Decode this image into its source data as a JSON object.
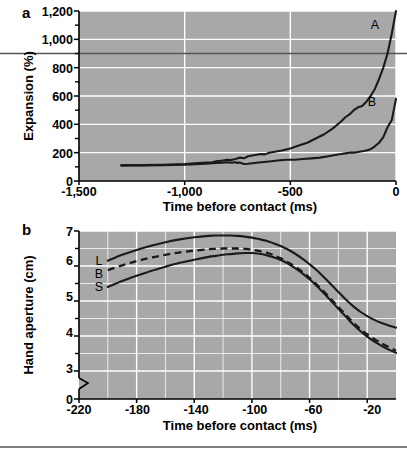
{
  "figure": {
    "panels": [
      "a",
      "b"
    ],
    "background": "#ffffff",
    "plot_bg": "#a8a8a8",
    "gridline_color": "#ffffff",
    "curve_color": "#1a1a1a",
    "reference_line_color": "#555555"
  },
  "panel_a": {
    "label": "a",
    "ylabel": "Expansion (%)",
    "xlabel": "Time before contact (ms)",
    "yticks": [
      "0",
      "200",
      "400",
      "600",
      "800",
      "1,000",
      "1,200"
    ],
    "xticks": [
      "-1,500",
      "-1,000",
      "-500",
      "0"
    ],
    "curve_labels": {
      "a": "A",
      "b": "B"
    }
  },
  "panel_b": {
    "label": "b",
    "ylabel": "Hand aperture (cm)",
    "xlabel": "Time before contact (ms)",
    "yticks": [
      "0",
      "3",
      "4",
      "5",
      "6",
      "7"
    ],
    "xticks": [
      "-220",
      "-180",
      "-140",
      "-100",
      "-60",
      "-20"
    ],
    "series_labels": {
      "l": "L",
      "b": "B",
      "s": "S"
    },
    "axis_break": true
  },
  "chart_data": [
    {
      "type": "line",
      "panel": "a",
      "title": "",
      "xlabel": "Time before contact (ms)",
      "ylabel": "Expansion (%)",
      "xlim": [
        -1500,
        0
      ],
      "ylim": [
        0,
        1200
      ],
      "xticks": [
        -1500,
        -1000,
        -500,
        0
      ],
      "yticks": [
        0,
        200,
        400,
        600,
        800,
        1000,
        1200
      ],
      "yminorticks": [
        100,
        300,
        500,
        700,
        900,
        1100
      ],
      "grid": true,
      "legend": "inline-curve-labels",
      "annotations": [
        {
          "text": "A",
          "x": -110,
          "y": 1090
        },
        {
          "text": "B",
          "x": -55,
          "y": 560
        }
      ],
      "reference_line": {
        "y": 900,
        "orientation": "horizontal",
        "spans_full_width": true
      },
      "series": [
        {
          "name": "A",
          "style": "solid",
          "x": [
            -1300,
            -1200,
            -1100,
            -1000,
            -950,
            -900,
            -870,
            -850,
            -820,
            -800,
            -780,
            -760,
            -740,
            -720,
            -700,
            -680,
            -660,
            -640,
            -620,
            -600,
            -580,
            -560,
            -540,
            -500,
            -460,
            -420,
            -380,
            -340,
            -300,
            -260,
            -240,
            -220,
            -200,
            -180,
            -160,
            -140,
            -120,
            -100,
            -80,
            -60,
            -40,
            -20,
            0
          ],
          "y": [
            110,
            112,
            115,
            120,
            125,
            130,
            132,
            140,
            145,
            150,
            148,
            155,
            165,
            160,
            175,
            180,
            185,
            190,
            188,
            200,
            205,
            210,
            215,
            230,
            250,
            270,
            300,
            330,
            370,
            420,
            450,
            470,
            500,
            520,
            530,
            560,
            600,
            650,
            720,
            800,
            900,
            1040,
            1200
          ]
        },
        {
          "name": "B",
          "style": "solid",
          "x": [
            -1300,
            -1200,
            -1100,
            -1000,
            -950,
            -900,
            -870,
            -850,
            -820,
            -800,
            -780,
            -760,
            -750,
            -740,
            -720,
            -700,
            -680,
            -650,
            -600,
            -560,
            -520,
            -480,
            -440,
            -400,
            -360,
            -320,
            -300,
            -280,
            -260,
            -240,
            -220,
            -200,
            -180,
            -160,
            -140,
            -120,
            -100,
            -80,
            -60,
            -40,
            -20,
            0
          ],
          "y": [
            110,
            110,
            112,
            115,
            118,
            122,
            125,
            128,
            130,
            132,
            130,
            132,
            128,
            130,
            120,
            122,
            125,
            130,
            138,
            145,
            150,
            150,
            155,
            160,
            165,
            175,
            180,
            185,
            190,
            195,
            200,
            200,
            205,
            210,
            215,
            225,
            245,
            270,
            310,
            380,
            430,
            580
          ]
        }
      ]
    },
    {
      "type": "line",
      "panel": "b",
      "title": "",
      "xlabel": "Time before contact (ms)",
      "ylabel": "Hand aperture (cm)",
      "xlim": [
        -220,
        0
      ],
      "ylim": [
        3,
        7
      ],
      "xticks": [
        -220,
        -180,
        -140,
        -100,
        -60,
        -20
      ],
      "yticks": [
        0,
        3,
        4,
        5,
        6,
        7
      ],
      "yminorticks": [
        3.5,
        4.5,
        5.5,
        6.5
      ],
      "grid": true,
      "axis_break_between": [
        0,
        3
      ],
      "legend": "inline-series-labels",
      "series": [
        {
          "name": "L",
          "style": "solid",
          "x": [
            -200,
            -190,
            -180,
            -170,
            -160,
            -150,
            -140,
            -130,
            -125,
            -120,
            -115,
            -110,
            -105,
            -100,
            -95,
            -90,
            -85,
            -80,
            -75,
            -70,
            -65,
            -60,
            -55,
            -50,
            -45,
            -40,
            -35,
            -30,
            -25,
            -20,
            -15,
            -10,
            -5,
            0
          ],
          "y": [
            6.15,
            6.32,
            6.46,
            6.58,
            6.68,
            6.76,
            6.82,
            6.86,
            6.87,
            6.87,
            6.87,
            6.86,
            6.84,
            6.81,
            6.77,
            6.72,
            6.65,
            6.57,
            6.47,
            6.35,
            6.21,
            6.05,
            5.88,
            5.68,
            5.47,
            5.26,
            5.05,
            4.86,
            4.7,
            4.57,
            4.46,
            4.37,
            4.3,
            4.24
          ]
        },
        {
          "name": "B",
          "style": "dashed",
          "x": [
            -200,
            -190,
            -180,
            -170,
            -160,
            -150,
            -140,
            -130,
            -125,
            -120,
            -115,
            -110,
            -105,
            -100,
            -95,
            -90,
            -85,
            -80,
            -75,
            -70,
            -65,
            -60,
            -55,
            -50,
            -45,
            -40,
            -35,
            -30,
            -25,
            -20,
            -15,
            -10,
            -5,
            0
          ],
          "y": [
            5.88,
            6.02,
            6.14,
            6.24,
            6.32,
            6.39,
            6.44,
            6.48,
            6.49,
            6.5,
            6.5,
            6.5,
            6.49,
            6.47,
            6.43,
            6.38,
            6.31,
            6.22,
            6.11,
            5.98,
            5.83,
            5.66,
            5.47,
            5.27,
            5.05,
            4.83,
            4.61,
            4.4,
            4.21,
            4.05,
            3.91,
            3.79,
            3.68,
            3.58
          ]
        },
        {
          "name": "S",
          "style": "solid",
          "x": [
            -200,
            -190,
            -180,
            -170,
            -160,
            -150,
            -140,
            -130,
            -125,
            -120,
            -115,
            -110,
            -105,
            -100,
            -95,
            -90,
            -85,
            -80,
            -75,
            -70,
            -65,
            -60,
            -55,
            -50,
            -45,
            -40,
            -35,
            -30,
            -25,
            -20,
            -15,
            -10,
            -5,
            0
          ],
          "y": [
            5.4,
            5.57,
            5.72,
            5.86,
            5.98,
            6.09,
            6.18,
            6.26,
            6.29,
            6.32,
            6.34,
            6.36,
            6.37,
            6.37,
            6.35,
            6.31,
            6.25,
            6.17,
            6.07,
            5.94,
            5.79,
            5.62,
            5.43,
            5.22,
            5.0,
            4.78,
            4.56,
            4.34,
            4.15,
            3.98,
            3.84,
            3.72,
            3.61,
            3.52
          ]
        }
      ]
    }
  ]
}
